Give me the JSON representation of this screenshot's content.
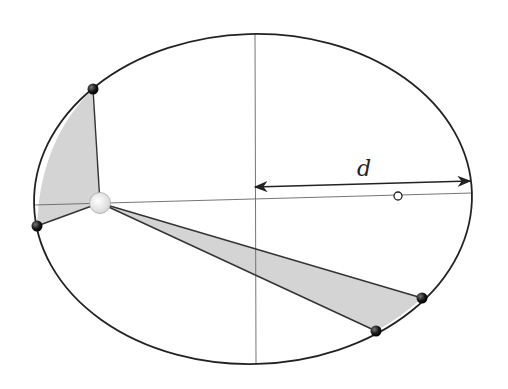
{
  "diagram": {
    "labels": {
      "distance": "d"
    },
    "ellipse": {
      "cx": 253,
      "cy": 199,
      "rx": 219,
      "ry": 165,
      "rotation_deg": -1.6
    },
    "sun": {
      "x": 100,
      "y": 203,
      "r": 10
    },
    "empty_focus": {
      "x": 398,
      "y": 196,
      "r": 4
    },
    "planets": [
      {
        "name": "planet-top-left",
        "x": 93,
        "y": 89
      },
      {
        "name": "planet-left",
        "x": 37,
        "y": 226
      },
      {
        "name": "planet-lower-right-1",
        "x": 422,
        "y": 298
      },
      {
        "name": "planet-lower-right-2",
        "x": 376,
        "y": 331
      }
    ],
    "colors": {
      "line": "#222222",
      "shaded": "#d4d4d4",
      "axis": "#555555",
      "sun": "#f2f2f2",
      "planet": "#1a1a1a"
    }
  }
}
